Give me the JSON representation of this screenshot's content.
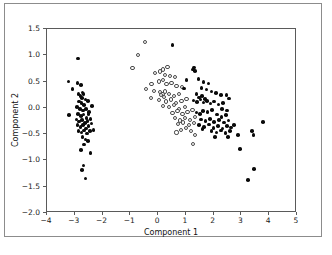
{
  "figure": {
    "width": 332,
    "height": 255,
    "background": "#ffffff",
    "frame_color": "#8c8c8c",
    "axes_color": "#5a5a5a"
  },
  "chart_data": {
    "type": "scatter",
    "title": "",
    "xlabel": "Component 1",
    "ylabel": "Component 2",
    "xlim": [
      -4,
      5
    ],
    "ylim": [
      -2.0,
      1.5
    ],
    "xticks": [
      -4,
      -3,
      -2,
      -1,
      0,
      1,
      2,
      3,
      4,
      5
    ],
    "xticklabels": [
      "−4",
      "−3",
      "−2",
      "−1",
      "0",
      "1",
      "2",
      "3",
      "4",
      "5"
    ],
    "yticks": [
      -2.0,
      -1.5,
      -1.0,
      -0.5,
      0.0,
      0.5,
      1.0,
      1.5
    ],
    "yticklabels": [
      "−2.0",
      "−1.5",
      "−1.0",
      "−0.5",
      "0.0",
      "0.5",
      "1.0",
      "1.5"
    ],
    "grid": false,
    "legend": null,
    "marker_colors": {
      "filled": "#0a0a0a",
      "open_edge": "#4a4a4a",
      "open_face": "#ffffff"
    },
    "series": [
      {
        "name": "cluster-left",
        "marker": "filled",
        "points": [
          [
            -2.88,
            0.94
          ],
          [
            -3.22,
            0.5
          ],
          [
            -2.9,
            0.47
          ],
          [
            -3.08,
            0.36
          ],
          [
            -2.78,
            0.44
          ],
          [
            -2.72,
            0.29
          ],
          [
            -2.86,
            0.26
          ],
          [
            -2.8,
            0.22
          ],
          [
            -2.74,
            0.19
          ],
          [
            -2.68,
            0.26
          ],
          [
            -2.62,
            0.16
          ],
          [
            -2.84,
            0.12
          ],
          [
            -2.76,
            0.09
          ],
          [
            -2.66,
            0.05
          ],
          [
            -2.52,
            0.13
          ],
          [
            -3.2,
            -0.14
          ],
          [
            -2.92,
            0.02
          ],
          [
            -2.82,
            -0.02
          ],
          [
            -2.7,
            -0.05
          ],
          [
            -2.6,
            -0.02
          ],
          [
            -2.48,
            -0.08
          ],
          [
            -2.38,
            0.03
          ],
          [
            -2.88,
            -0.12
          ],
          [
            -2.78,
            -0.16
          ],
          [
            -2.68,
            -0.13
          ],
          [
            -2.58,
            -0.19
          ],
          [
            -2.5,
            -0.12
          ],
          [
            -2.94,
            -0.22
          ],
          [
            -2.84,
            -0.26
          ],
          [
            -2.74,
            -0.23
          ],
          [
            -2.64,
            -0.29
          ],
          [
            -2.54,
            -0.25
          ],
          [
            -2.44,
            -0.21
          ],
          [
            -2.9,
            -0.33
          ],
          [
            -2.8,
            -0.36
          ],
          [
            -2.7,
            -0.33
          ],
          [
            -2.6,
            -0.39
          ],
          [
            -2.5,
            -0.35
          ],
          [
            -2.4,
            -0.3
          ],
          [
            -2.32,
            -0.42
          ],
          [
            -2.86,
            -0.44
          ],
          [
            -2.76,
            -0.47
          ],
          [
            -2.66,
            -0.43
          ],
          [
            -2.56,
            -0.49
          ],
          [
            -2.46,
            -0.44
          ],
          [
            -2.72,
            -0.56
          ],
          [
            -2.62,
            -0.6
          ],
          [
            -2.52,
            -0.63
          ],
          [
            -2.66,
            -0.7
          ],
          [
            -2.78,
            -0.8
          ],
          [
            -2.44,
            -0.86
          ],
          [
            -2.68,
            -1.1
          ],
          [
            -2.74,
            -1.18
          ],
          [
            -2.62,
            -1.34
          ]
        ]
      },
      {
        "name": "cluster-middle-open",
        "marker": "open",
        "points": [
          [
            -0.46,
            1.26
          ],
          [
            -0.72,
            1.01
          ],
          [
            -0.92,
            0.76
          ],
          [
            0.18,
            0.73
          ],
          [
            0.34,
            0.77
          ],
          [
            -0.1,
            0.66
          ],
          [
            0.06,
            0.69
          ],
          [
            0.24,
            0.63
          ],
          [
            0.44,
            0.6
          ],
          [
            0.62,
            0.58
          ],
          [
            0.18,
            0.53
          ],
          [
            0.02,
            0.5
          ],
          [
            -0.24,
            0.46
          ],
          [
            0.3,
            0.45
          ],
          [
            0.48,
            0.47
          ],
          [
            0.66,
            0.42
          ],
          [
            0.86,
            0.39
          ],
          [
            -0.44,
            0.36
          ],
          [
            -0.14,
            0.32
          ],
          [
            0.08,
            0.3
          ],
          [
            0.16,
            0.27
          ],
          [
            0.24,
            0.31
          ],
          [
            0.1,
            0.24
          ],
          [
            0.2,
            0.21
          ],
          [
            0.38,
            0.26
          ],
          [
            0.56,
            0.23
          ],
          [
            0.74,
            0.27
          ],
          [
            -0.26,
            0.18
          ],
          [
            0.02,
            0.15
          ],
          [
            0.28,
            0.12
          ],
          [
            0.46,
            0.16
          ],
          [
            0.64,
            0.09
          ],
          [
            0.84,
            0.13
          ],
          [
            1.02,
            0.17
          ],
          [
            0.18,
            0.04
          ],
          [
            0.4,
            0.01
          ],
          [
            0.58,
            0.05
          ],
          [
            0.76,
            -0.02
          ],
          [
            0.96,
            0.02
          ],
          [
            0.52,
            -0.1
          ],
          [
            0.7,
            -0.06
          ],
          [
            0.88,
            -0.12
          ],
          [
            1.06,
            -0.08
          ],
          [
            1.24,
            -0.04
          ],
          [
            0.62,
            -0.2
          ],
          [
            0.8,
            -0.24
          ],
          [
            0.98,
            -0.19
          ],
          [
            1.16,
            -0.23
          ],
          [
            1.34,
            -0.18
          ],
          [
            0.72,
            -0.31
          ],
          [
            0.9,
            -0.28
          ],
          [
            1.1,
            -0.33
          ],
          [
            1.28,
            -0.29
          ],
          [
            0.82,
            -0.42
          ],
          [
            1.0,
            -0.39
          ],
          [
            1.18,
            -0.44
          ],
          [
            0.66,
            -0.47
          ],
          [
            1.34,
            -0.52
          ],
          [
            1.26,
            -0.68
          ]
        ]
      },
      {
        "name": "cluster-right-filled",
        "marker": "filled",
        "points": [
          [
            0.52,
            1.19
          ],
          [
            1.3,
            0.77
          ],
          [
            1.26,
            0.73
          ],
          [
            1.32,
            0.7
          ],
          [
            1.46,
            0.55
          ],
          [
            1.02,
            0.53
          ],
          [
            1.64,
            0.49
          ],
          [
            1.82,
            0.46
          ],
          [
            1.56,
            0.38
          ],
          [
            0.94,
            0.37
          ],
          [
            1.74,
            0.35
          ],
          [
            1.92,
            0.31
          ],
          [
            2.08,
            0.28
          ],
          [
            2.26,
            0.24
          ],
          [
            1.38,
            0.26
          ],
          [
            1.48,
            0.2
          ],
          [
            1.58,
            0.23
          ],
          [
            1.68,
            0.17
          ],
          [
            1.28,
            0.14
          ],
          [
            1.4,
            0.11
          ],
          [
            1.52,
            0.16
          ],
          [
            1.64,
            0.1
          ],
          [
            1.76,
            0.13
          ],
          [
            1.88,
            0.08
          ],
          [
            2.02,
            0.12
          ],
          [
            2.18,
            0.06
          ],
          [
            2.34,
            0.09
          ],
          [
            2.46,
            0.24
          ],
          [
            2.56,
            0.18
          ],
          [
            2.3,
            -0.02
          ],
          [
            2.48,
            -0.05
          ],
          [
            1.94,
            -0.04
          ],
          [
            1.78,
            -0.08
          ],
          [
            1.62,
            -0.06
          ],
          [
            1.5,
            -0.12
          ],
          [
            1.38,
            -0.09
          ],
          [
            2.12,
            -0.13
          ],
          [
            2.28,
            -0.17
          ],
          [
            2.44,
            -0.14
          ],
          [
            1.54,
            -0.22
          ],
          [
            1.7,
            -0.25
          ],
          [
            1.86,
            -0.21
          ],
          [
            2.02,
            -0.27
          ],
          [
            2.2,
            -0.23
          ],
          [
            2.38,
            -0.28
          ],
          [
            2.54,
            -0.24
          ],
          [
            1.48,
            -0.33
          ],
          [
            1.66,
            -0.36
          ],
          [
            1.84,
            -0.32
          ],
          [
            2.0,
            -0.38
          ],
          [
            2.16,
            -0.34
          ],
          [
            2.32,
            -0.39
          ],
          [
            2.48,
            -0.35
          ],
          [
            2.62,
            -0.37
          ],
          [
            2.74,
            -0.33
          ],
          [
            1.92,
            -0.44
          ],
          [
            2.1,
            -0.47
          ],
          [
            2.26,
            -0.43
          ],
          [
            2.42,
            -0.48
          ],
          [
            2.58,
            -0.44
          ],
          [
            1.6,
            -0.4
          ],
          [
            2.04,
            -0.56
          ],
          [
            2.52,
            -0.56
          ],
          [
            2.88,
            -0.52
          ],
          [
            3.44,
            -0.52
          ],
          [
            3.38,
            -0.44
          ],
          [
            3.78,
            -0.27
          ],
          [
            2.94,
            -0.78
          ],
          [
            3.46,
            -1.16
          ],
          [
            3.24,
            -1.37
          ]
        ]
      }
    ]
  },
  "axes": {
    "xlabel": "Component 1",
    "ylabel": "Component 2"
  }
}
